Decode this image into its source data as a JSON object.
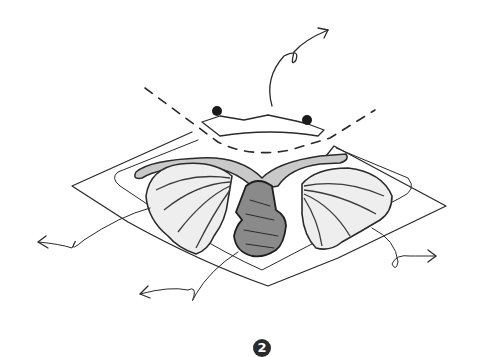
{
  "illustration": {
    "description": "Hand-drawn sketch: a flap of skin lifted open revealing a central column flanked by two fan-shaped ribbed glandular lobes joined by a beaded duct; arrows indicate movement outward",
    "figure_number": "2",
    "colors": {
      "ink": "#2a2a2a",
      "background": "#ffffff",
      "badge": "#2b2b2b"
    },
    "elements": [
      "outer-diamond-outline",
      "inner-diamond-outline",
      "dashed-incision-line",
      "lifted-flap",
      "left-marker-dot",
      "right-marker-dot",
      "left-fan-lobe",
      "right-fan-lobe",
      "beaded-duct",
      "central-column",
      "arrow-up",
      "arrow-left",
      "arrow-bottom-left",
      "arrow-right"
    ]
  }
}
